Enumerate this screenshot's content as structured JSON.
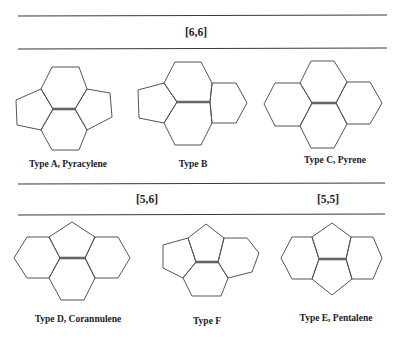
{
  "figure": {
    "sections": [
      {
        "header": "[6,6]"
      },
      {
        "header": "[5,6]"
      },
      {
        "header": "[5,5]"
      }
    ],
    "structures": [
      {
        "id": "A",
        "label": "Type A, Pyracylene",
        "rings": "pentagon-hexagon-hexagon-pentagon"
      },
      {
        "id": "B",
        "label": "Type B",
        "rings": "pentagon-hexagon-hexagon-hexagon"
      },
      {
        "id": "C",
        "label": "Type C, Pyrene",
        "rings": "hexagon x4"
      },
      {
        "id": "D",
        "label": "Type D, Corannulene",
        "rings": "pentagon-hexagon x3"
      },
      {
        "id": "F",
        "label": "Type F",
        "rings": "pentagon x2-hexagon x2"
      },
      {
        "id": "E",
        "label": "Type E, Pentalene",
        "rings": "pentagon x2-hexagon x2"
      }
    ],
    "colors": {
      "line": "#555555",
      "central_bond": "#666666",
      "text": "#222222",
      "background": "#ffffff"
    }
  }
}
